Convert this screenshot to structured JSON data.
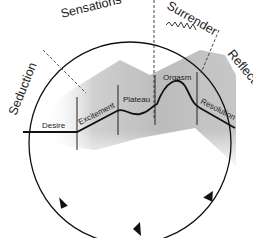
{
  "diagram": {
    "title": "",
    "cycle_labels": {
      "seduction": "Seduction",
      "sensations": "Sensations",
      "surrender": "Surrender",
      "reflection": "Reflection"
    },
    "phase_labels": {
      "desire": "Desire",
      "excitement": "Excitement",
      "plateau": "Plateau",
      "orgasm": "Orgasm",
      "resolution": "Resolution"
    },
    "colors": {
      "line": "#111111",
      "shading_dark": "#b5b5b5",
      "shading_light": "#e8e8e8",
      "dashed": "#555555"
    },
    "cycle_direction": "clockwise"
  }
}
